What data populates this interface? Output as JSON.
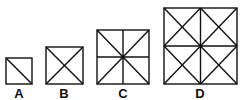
{
  "figures": [
    {
      "label": "A",
      "description": "square with one diagonal"
    },
    {
      "label": "B",
      "description": "square with both diagonals"
    },
    {
      "label": "C",
      "description": "square with both diagonals and both midlines"
    },
    {
      "label": "D",
      "description": "2x2 grid of squares, each with both diagonals"
    }
  ],
  "colors": {
    "stroke": "#111111",
    "background": "#ffffff"
  }
}
